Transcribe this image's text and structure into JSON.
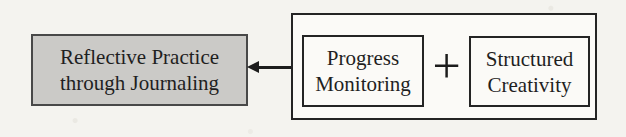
{
  "figure": {
    "background_color": "#f4f3ef",
    "result_box": {
      "lines": [
        "Reflective Practice",
        "through Journaling"
      ],
      "fill_color": "#cbcac7",
      "border_color": "#484848",
      "text_color": "#1f1f1f"
    },
    "arrow": {
      "direction": "left",
      "color": "#1c1c1c"
    },
    "group_box": {
      "border_color": "#242424",
      "fill_color": "#fbfaf7",
      "operator": "+",
      "items": [
        {
          "lines": [
            "Progress",
            "Monitoring"
          ]
        },
        {
          "lines": [
            "Structured",
            "Creativity"
          ]
        }
      ]
    }
  }
}
